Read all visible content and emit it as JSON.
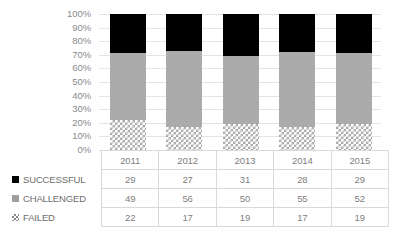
{
  "chart_data": {
    "type": "bar",
    "subtype": "stacked-100-percent-column",
    "title": "",
    "xlabel": "",
    "ylabel": "",
    "ylim": [
      0,
      100
    ],
    "ytick_labels": [
      "100%",
      "90%",
      "80%",
      "70%",
      "60%",
      "50%",
      "40%",
      "30%",
      "20%",
      "10%",
      "0%"
    ],
    "ytick_values": [
      100,
      90,
      80,
      70,
      60,
      50,
      40,
      30,
      20,
      10,
      0
    ],
    "grid": true,
    "legend_position": "data-table-row-headers",
    "categories": [
      "2011",
      "2012",
      "2013",
      "2014",
      "2015"
    ],
    "series": [
      {
        "name": "SUCCESSFUL",
        "values": [
          29,
          27,
          31,
          28,
          29
        ],
        "color": "#000000",
        "marker": "solid-black-square",
        "stack_order": "top"
      },
      {
        "name": "CHALLENGED",
        "values": [
          49,
          56,
          50,
          55,
          52
        ],
        "color": "#ababab",
        "marker": "solid-gray-square",
        "stack_order": "middle"
      },
      {
        "name": "FAILED",
        "values": [
          22,
          17,
          19,
          17,
          19
        ],
        "color": "#a8a8a8",
        "marker": "checkered-square",
        "pattern": "checkerboard",
        "stack_order": "bottom"
      }
    ],
    "data_table": {
      "header_row": [
        "",
        "2011",
        "2012",
        "2013",
        "2014",
        "2015"
      ],
      "rows": [
        {
          "label": "SUCCESSFUL",
          "marker": "solid-black-square",
          "values": [
            "29",
            "27",
            "31",
            "28",
            "29"
          ]
        },
        {
          "label": "CHALLENGED",
          "marker": "solid-gray-square",
          "values": [
            "49",
            "56",
            "50",
            "55",
            "52"
          ]
        },
        {
          "label": "FAILED",
          "marker": "checkered-square",
          "values": [
            "22",
            "17",
            "19",
            "17",
            "19"
          ]
        }
      ]
    },
    "colors": {
      "successful": "#000000",
      "challenged": "#ababab",
      "failed": "#a8a8a8",
      "gridline": "#e4e4e4",
      "table_border": "#d9d9d9",
      "text": "#808080",
      "background": "#ffffff"
    }
  }
}
